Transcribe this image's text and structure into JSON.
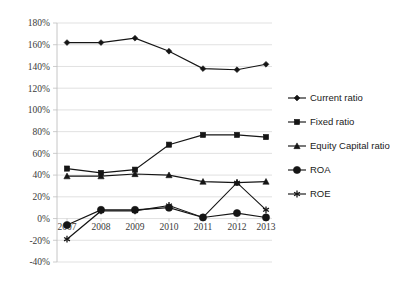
{
  "chart_data": {
    "type": "line",
    "title": "",
    "subtitle": "",
    "xlabel": "",
    "ylabel": "",
    "categories": [
      "2007",
      "2008",
      "2009",
      "2010",
      "2011",
      "2012",
      "2013"
    ],
    "ylim": [
      -40,
      180
    ],
    "ytick_step": 20,
    "ytick_labels": [
      "180%",
      "160%",
      "140%",
      "120%",
      "100%",
      "80%",
      "60%",
      "40%",
      "20%",
      "0%",
      "-20%",
      "-40%"
    ],
    "ytick_values": [
      180,
      160,
      140,
      120,
      100,
      80,
      60,
      40,
      20,
      0,
      -20,
      -40
    ],
    "grid": true,
    "legend_position": "right",
    "value_unit": "%",
    "series": [
      {
        "name": "Current ratio",
        "marker": "diamond",
        "values": [
          162,
          162,
          166,
          154,
          138,
          137,
          142
        ]
      },
      {
        "name": "Fixed ratio",
        "marker": "square",
        "values": [
          46,
          42,
          45,
          68,
          77,
          77,
          75
        ]
      },
      {
        "name": "Equity Capital ratio",
        "marker": "triangle",
        "values": [
          39,
          39,
          41,
          40,
          34,
          33,
          34
        ]
      },
      {
        "name": "ROA",
        "marker": "circle",
        "values": [
          -6,
          8,
          8,
          10,
          1,
          5,
          1
        ]
      },
      {
        "name": "ROE",
        "marker": "star",
        "values": [
          -19,
          7,
          7,
          12,
          1,
          33,
          8
        ]
      }
    ]
  },
  "colors": {
    "series": "#151515",
    "gridline": "#d9d9d9",
    "axis": "#bfbfbf",
    "text": "#3a3a3a",
    "background": "#ffffff"
  }
}
